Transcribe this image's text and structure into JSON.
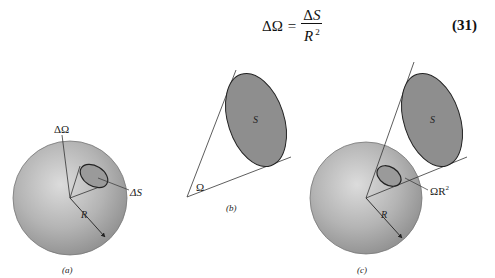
{
  "equation": {
    "lhs": "ΔΩ",
    "equals": "=",
    "numerator_delta": "Δ",
    "numerator_var": "S",
    "denominator_var": "R",
    "denominator_exp": "2",
    "number": "(31)"
  },
  "figures": {
    "a": {
      "caption": "(a)",
      "solid_angle_label": "ΔΩ",
      "area_label": "ΔS",
      "radius_label": "R"
    },
    "b": {
      "caption": "(b)",
      "surface_label": "S",
      "angle_label": "Ω"
    },
    "c": {
      "caption": "(c)",
      "surface_label": "S",
      "projected_label": "ΩR",
      "projected_exp": "2",
      "radius_label": "R"
    }
  },
  "colors": {
    "sphere_light": "#d6d6d6",
    "sphere_dark": "#8e8e8e",
    "ellipse_fill": "#8a8a8a",
    "stroke": "#333333"
  }
}
